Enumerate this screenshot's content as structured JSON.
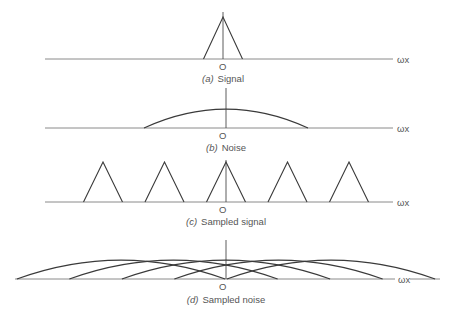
{
  "chart_data": {
    "type": "diagram",
    "axis_label": "ωx",
    "origin_label": "O",
    "panels": [
      {
        "id": "a",
        "tag": "(a)",
        "caption": "Signal",
        "shape": "triangle",
        "centers": [
          0
        ],
        "half_width": 0.12,
        "height": 1.0
      },
      {
        "id": "b",
        "tag": "(b)",
        "caption": "Noise",
        "shape": "hump",
        "centers": [
          0
        ],
        "half_width": 0.5,
        "height": 0.45
      },
      {
        "id": "c",
        "tag": "(c)",
        "caption": "Sampled signal",
        "shape": "triangle",
        "centers": [
          -2,
          -1,
          0,
          1,
          2
        ],
        "half_width": 0.12,
        "height": 0.9
      },
      {
        "id": "d",
        "tag": "(d)",
        "caption": "Sampled noise",
        "shape": "hump",
        "centers": [
          -2,
          -1,
          0,
          1,
          2
        ],
        "half_width": 0.5,
        "height": 0.45
      }
    ]
  }
}
